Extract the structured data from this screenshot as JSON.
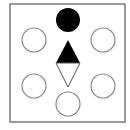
{
  "diagram": {
    "colors": {
      "background": "#ffffff",
      "frame_stroke": "#7a7a7a",
      "outline_stroke": "#8c8c8c",
      "filled": "#000000",
      "triangle_outline": "#555555"
    },
    "frame": {
      "x": 10,
      "y": 4,
      "width": 115,
      "height": 118
    },
    "filled_circle": {
      "cx": 68,
      "cy": 20,
      "r": 12
    },
    "outline_circles": [
      {
        "position": "top-left",
        "cx": 34,
        "cy": 40,
        "r": 12
      },
      {
        "position": "top-right",
        "cx": 103,
        "cy": 40,
        "r": 12
      },
      {
        "position": "bottom-left",
        "cx": 34,
        "cy": 86,
        "r": 12
      },
      {
        "position": "bottom-right",
        "cx": 103,
        "cy": 86,
        "r": 12
      },
      {
        "position": "bottom-center",
        "cx": 68,
        "cy": 104,
        "r": 12
      }
    ],
    "filled_triangle": {
      "points": "68,40 56,63 80,63"
    },
    "outline_triangle": {
      "points": "56,63 80,63 68,87"
    }
  }
}
